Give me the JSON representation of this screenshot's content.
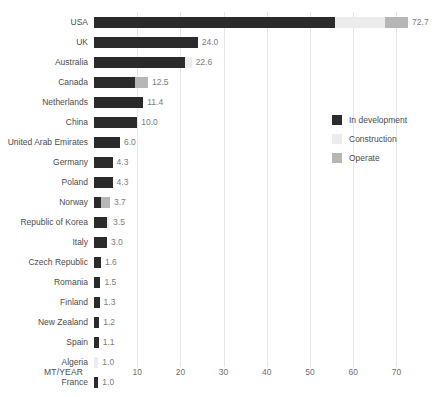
{
  "chart_data": {
    "type": "bar",
    "orientation": "horizontal",
    "stacked": true,
    "title": "",
    "xlabel": "MT/YEAR",
    "ylabel": "",
    "xlim": [
      0,
      72.7
    ],
    "xticks": [
      10,
      20,
      30,
      40,
      50,
      60,
      70
    ],
    "xtick_labels": [
      "10",
      "20",
      "30",
      "40",
      "50",
      "60",
      "70"
    ],
    "grid": "vertical",
    "legend_position": "center-right",
    "categories": [
      "USA",
      "UK",
      "Australia",
      "Canada",
      "Netherlands",
      "China",
      "United Arab Emirates",
      "Germany",
      "Poland",
      "Norway",
      "Republic of Korea",
      "Italy",
      "Czech Republic",
      "Romania",
      "Finland",
      "New Zealand",
      "Spain",
      "Algeria",
      "France"
    ],
    "series": [
      {
        "name": "In development",
        "color": "#2b2b2b",
        "values": [
          55.8,
          24.0,
          21.0,
          9.5,
          11.4,
          10.0,
          6.0,
          4.3,
          4.3,
          1.6,
          3.0,
          3.0,
          1.6,
          1.5,
          1.3,
          1.2,
          1.1,
          0.0,
          1.0
        ]
      },
      {
        "name": "Construction",
        "color": "#ececec",
        "values": [
          11.6,
          0.0,
          1.6,
          0.0,
          0.0,
          0.0,
          0.0,
          0.0,
          0.0,
          0.0,
          0.5,
          0.0,
          0.0,
          0.0,
          0.0,
          0.0,
          0.0,
          1.0,
          0.0
        ]
      },
      {
        "name": "Operate",
        "color": "#b6b6b6",
        "values": [
          5.3,
          0.0,
          0.0,
          3.0,
          0.0,
          0.0,
          0.0,
          0.0,
          0.0,
          2.1,
          0.0,
          0.0,
          0.0,
          0.0,
          0.0,
          0.0,
          0.0,
          0.0,
          0.0
        ]
      }
    ],
    "totals": [
      72.7,
      24.0,
      22.6,
      12.5,
      11.4,
      10.0,
      6.0,
      4.3,
      4.3,
      3.7,
      3.5,
      3.0,
      1.6,
      1.5,
      1.3,
      1.2,
      1.1,
      1.0,
      1.0
    ],
    "value_labels": [
      "72.7",
      "24.0",
      "22.6",
      "12.5",
      "11.4",
      "10.0",
      "6.0",
      "4.3",
      "4.3",
      "3.7",
      "3.5",
      "3.0",
      "1.6",
      "1.5",
      "1.3",
      "1.2",
      "1.1",
      "1.0",
      "1.0"
    ]
  },
  "legend": {
    "items": [
      {
        "label": "In development",
        "color": "#2b2b2b"
      },
      {
        "label": "Construction",
        "color": "#ececec"
      },
      {
        "label": "Operate",
        "color": "#b6b6b6"
      }
    ]
  },
  "axis": {
    "title": "MT/YEAR"
  }
}
